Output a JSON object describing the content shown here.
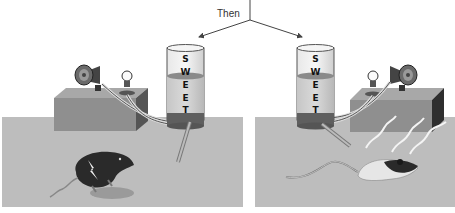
{
  "header": {
    "connector_label": "Then"
  },
  "panels": [
    {
      "id": "left",
      "description": "Rat receives shock after tasting sweet water with light and sound cues",
      "cylinder_label": [
        "S",
        "W",
        "E",
        "E",
        "T"
      ],
      "stimuli": [
        "speaker-icon",
        "light-bulb-icon"
      ],
      "rat_state": "shocked"
    },
    {
      "id": "right",
      "description": "Rat avoids sweet water; lies on floor near cues",
      "cylinder_label": [
        "S",
        "W",
        "E",
        "E",
        "T"
      ],
      "stimuli": [
        "light-bulb-icon",
        "speaker-icon"
      ],
      "rat_state": "sick"
    }
  ],
  "colors": {
    "floor": "#bdbdbd",
    "box_front": "#8f8f8f",
    "box_top": "#a6a6a6",
    "box_side": "#3a3a3a",
    "liquid": "#d4d4d4",
    "liquid_top": "#8a8a8a",
    "cylinder_base": "#5f5f5f"
  }
}
